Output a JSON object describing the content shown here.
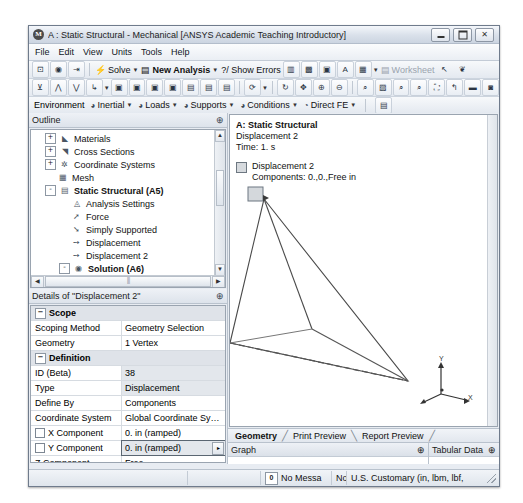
{
  "window": {
    "title": "A : Static Structural - Mechanical [ANSYS Academic Teaching Introductory]",
    "app_icon": "ansys-icon",
    "buttons": {
      "minimize": "minimize-icon",
      "maximize": "maximize-icon",
      "close": "✕"
    }
  },
  "menubar": {
    "items": [
      "File",
      "Edit",
      "View",
      "Units",
      "Tools",
      "Help"
    ]
  },
  "toolbar_main": {
    "solve_label": "Solve",
    "new_analysis_label": "New Analysis",
    "show_errors_label": "?/ Show Errors",
    "worksheet_label": "Worksheet"
  },
  "toolbar_env": {
    "environment_label": "Environment",
    "items": [
      "Inertial",
      "Loads",
      "Supports",
      "Conditions",
      "Direct FE"
    ]
  },
  "outline": {
    "title": "Outline",
    "pin": "⊕",
    "tree": [
      {
        "label": "Materials",
        "indent": 2,
        "expander": "+",
        "icon": "materials-icon",
        "bold": false
      },
      {
        "label": "Cross Sections",
        "indent": 2,
        "expander": "+",
        "icon": "cross-sections-icon",
        "bold": false
      },
      {
        "label": "Coordinate Systems",
        "indent": 2,
        "expander": "+",
        "icon": "coordinate-systems-icon",
        "bold": false
      },
      {
        "label": "Mesh",
        "indent": 2,
        "expander": "",
        "icon": "mesh-icon",
        "bold": false
      },
      {
        "label": "Static Structural (A5)",
        "indent": 2,
        "expander": "-",
        "icon": "environment-icon",
        "bold": true
      },
      {
        "label": "Analysis Settings",
        "indent": 4,
        "expander": "",
        "icon": "analysis-settings-icon",
        "bold": false
      },
      {
        "label": "Force",
        "indent": 4,
        "expander": "",
        "icon": "force-icon",
        "bold": false
      },
      {
        "label": "Simply Supported",
        "indent": 4,
        "expander": "",
        "icon": "support-icon",
        "bold": false
      },
      {
        "label": "Displacement",
        "indent": 4,
        "expander": "",
        "icon": "displacement-icon",
        "bold": false
      },
      {
        "label": "Displacement 2",
        "indent": 4,
        "expander": "",
        "icon": "displacement-icon",
        "bold": false
      },
      {
        "label": "Solution (A6)",
        "indent": 4,
        "expander": "-",
        "icon": "solution-icon",
        "bold": true
      },
      {
        "label": "Solution Informati",
        "indent": 6,
        "expander": "",
        "icon": "solution-info-icon",
        "bold": false
      }
    ]
  },
  "details": {
    "title": "Details of \"Displacement 2\"",
    "pin": "⊕",
    "rows": [
      {
        "type": "header",
        "key": "Scope",
        "value": ""
      },
      {
        "type": "row",
        "key": "Scoping Method",
        "value": "Geometry Selection",
        "shade": false,
        "checkbox": false
      },
      {
        "type": "row",
        "key": "Geometry",
        "value": "1 Vertex",
        "shade": false,
        "checkbox": false
      },
      {
        "type": "header",
        "key": "Definition",
        "value": ""
      },
      {
        "type": "row",
        "key": "ID (Beta)",
        "value": "38",
        "shade": true,
        "checkbox": false
      },
      {
        "type": "row",
        "key": "Type",
        "value": "Displacement",
        "shade": true,
        "checkbox": false
      },
      {
        "type": "row",
        "key": "Define By",
        "value": "Components",
        "shade": false,
        "checkbox": false
      },
      {
        "type": "row",
        "key": "Coordinate System",
        "value": "Global Coordinate Sy…",
        "shade": false,
        "checkbox": false
      },
      {
        "type": "row",
        "key": "X Component",
        "value": "0. in  (ramped)",
        "shade": false,
        "checkbox": true
      },
      {
        "type": "row",
        "key": "Y Component",
        "value": "0. in  (ramped)",
        "shade": true,
        "checkbox": true,
        "selected": true,
        "dropdown": "▸"
      },
      {
        "type": "row",
        "key": "Z Component",
        "value": "Free",
        "shade": false,
        "checkbox": false
      },
      {
        "type": "row",
        "key": "Suppressed",
        "value": "No",
        "shade": false,
        "checkbox": false
      }
    ]
  },
  "viewport": {
    "heading": "A: Static Structural",
    "subheading": "Displacement 2",
    "time": "Time: 1. s",
    "legend_label": "Displacement 2",
    "legend_components": "Components: 0.,0.,Free in",
    "legend_swatch_color": "#d6dade",
    "triad": {
      "x": "X",
      "y": "Y",
      "z": "Z"
    },
    "tabs": [
      {
        "label": "Geometry",
        "active": true
      },
      {
        "label": "Print Preview",
        "active": false
      },
      {
        "label": "Report Preview",
        "active": false
      }
    ]
  },
  "bottom_panels": {
    "graph": {
      "title": "Graph",
      "pin": "⊕"
    },
    "tabular": {
      "title": "Tabular Data",
      "pin": "⊕"
    }
  },
  "statusbar": {
    "messages": "No Messa",
    "message_count": "0",
    "selection": "No Selection",
    "units": "U.S. Customary (in, lbm, lbf,"
  }
}
